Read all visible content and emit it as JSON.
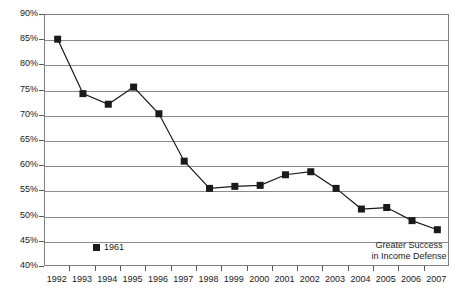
{
  "chart_data": {
    "type": "line",
    "title": "",
    "xlabel": "",
    "ylabel": "",
    "ylim": [
      40,
      90
    ],
    "ytick_step": 5,
    "grid": true,
    "legend_position": "inside-bottom-left",
    "categories": [
      "1992",
      "1993",
      "1994",
      "1995",
      "1996",
      "1997",
      "1998",
      "1999",
      "2000",
      "2001",
      "2002",
      "2003",
      "2004",
      "2005",
      "2006",
      "2007"
    ],
    "series": [
      {
        "name": "1961",
        "marker": "square",
        "color": "#1a1a1a",
        "values": [
          85.2,
          74.4,
          72.3,
          75.7,
          70.4,
          61.0,
          55.6,
          56.0,
          56.2,
          58.3,
          58.9,
          55.6,
          51.5,
          51.8,
          49.2,
          47.4
        ]
      }
    ],
    "ytick_labels": [
      "90%",
      "85%",
      "80%",
      "75%",
      "70%",
      "65%",
      "60%",
      "55%",
      "50%",
      "45%",
      "40%"
    ],
    "ytick_values": [
      90,
      85,
      80,
      75,
      70,
      65,
      60,
      55,
      50,
      45,
      40
    ],
    "annotations": [
      {
        "name": "greater-success-annotation",
        "line1": "Greater Success",
        "line2": "in Income Defense"
      }
    ]
  },
  "legend": {
    "entries": [
      {
        "label": "1961",
        "color": "#1a1a1a"
      }
    ]
  },
  "colors": {
    "series": "#1a1a1a",
    "gridline": "#8c8c8c",
    "frame": "#7f7f7f",
    "text": "#1a1a1a",
    "background": "#ffffff"
  }
}
